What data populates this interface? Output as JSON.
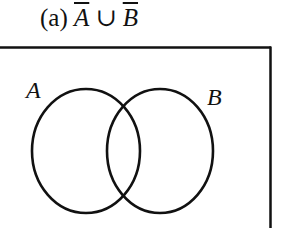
{
  "title": {
    "prefix": "(a)",
    "set_a": "A",
    "operator": "∪",
    "set_b": "B",
    "full_text": "(a) Ā ∪ B̄"
  },
  "diagram": {
    "type": "venn",
    "universe_box": {
      "visible_edges": [
        "top",
        "right"
      ]
    },
    "sets": [
      {
        "label": "A",
        "cx": 86,
        "cy": 151,
        "rx": 54,
        "ry": 62
      },
      {
        "label": "B",
        "cx": 160,
        "cy": 151,
        "rx": 53,
        "ry": 62
      }
    ],
    "shading": "none",
    "stroke_color": "#111111"
  }
}
